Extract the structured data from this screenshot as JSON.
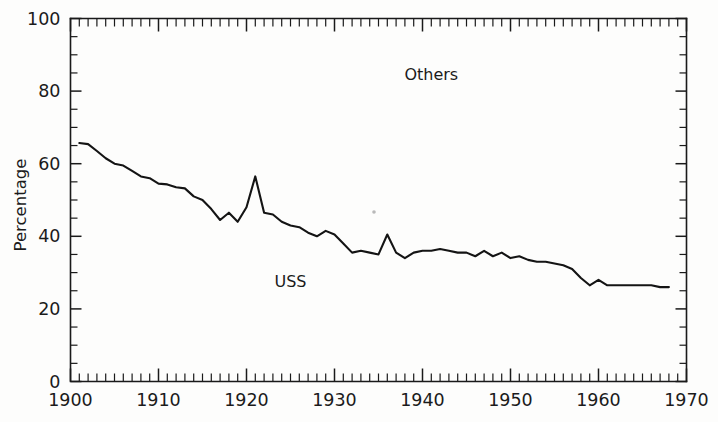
{
  "chart_data": {
    "type": "line",
    "title": "",
    "subtitle": "",
    "xlabel": "",
    "ylabel": "Percentage",
    "xlim": [
      1900,
      1970
    ],
    "ylim": [
      0,
      100
    ],
    "grid": false,
    "legend_position": "inline-annotations",
    "x_ticks": [
      1900,
      1910,
      1920,
      1930,
      1940,
      1950,
      1960,
      1970
    ],
    "x_tick_labels": [
      "1900",
      "1910",
      "1920",
      "1930",
      "1940",
      "1950",
      "1960",
      "1970"
    ],
    "x_minor_tick_interval": 1,
    "y_ticks": [
      0,
      20,
      40,
      60,
      80,
      100
    ],
    "y_tick_labels": [
      "0",
      "20",
      "40",
      "60",
      "80",
      "100"
    ],
    "y_minor_tick_interval": 5,
    "annotations": [
      {
        "text": "Others",
        "x": 1941,
        "y": 83,
        "region": "above-curve"
      },
      {
        "text": "USS",
        "x": 1925,
        "y": 26,
        "region": "below-curve"
      }
    ],
    "series": [
      {
        "name": "USS",
        "x": [
          1901,
          1902,
          1903,
          1904,
          1905,
          1906,
          1907,
          1908,
          1909,
          1910,
          1911,
          1912,
          1913,
          1914,
          1915,
          1916,
          1917,
          1918,
          1919,
          1920,
          1921,
          1922,
          1923,
          1924,
          1925,
          1926,
          1927,
          1928,
          1929,
          1930,
          1931,
          1932,
          1933,
          1934,
          1935,
          1936,
          1937,
          1938,
          1939,
          1940,
          1941,
          1942,
          1943,
          1944,
          1945,
          1946,
          1947,
          1948,
          1949,
          1950,
          1951,
          1952,
          1953,
          1954,
          1955,
          1956,
          1957,
          1958,
          1959,
          1960,
          1961,
          1962,
          1963,
          1964,
          1965,
          1966,
          1967,
          1968
        ],
        "values": [
          65.7,
          65.4,
          63.5,
          61.5,
          60.0,
          59.5,
          58.0,
          56.5,
          56.0,
          54.5,
          54.3,
          53.5,
          53.2,
          51.0,
          50.0,
          47.5,
          44.5,
          46.5,
          44.0,
          48.0,
          56.5,
          46.5,
          46.0,
          44.0,
          43.0,
          42.5,
          41.0,
          40.0,
          41.5,
          40.5,
          38.0,
          35.5,
          36.0,
          35.5,
          35.0,
          40.5,
          35.5,
          34.0,
          35.5,
          36.0,
          36.0,
          36.5,
          36.0,
          35.5,
          35.5,
          34.5,
          36.0,
          34.5,
          35.5,
          34.0,
          34.5,
          33.5,
          33.0,
          33.0,
          32.5,
          32.0,
          31.0,
          28.5,
          26.5,
          28.0,
          26.5,
          26.5,
          26.5,
          26.5,
          26.5,
          26.5,
          26.0,
          26.0
        ]
      }
    ]
  },
  "axis": {
    "y_title": "Percentage"
  },
  "colors": {
    "line": "#141414",
    "axis": "#1a1a1a",
    "background": "#fdfdfc"
  }
}
